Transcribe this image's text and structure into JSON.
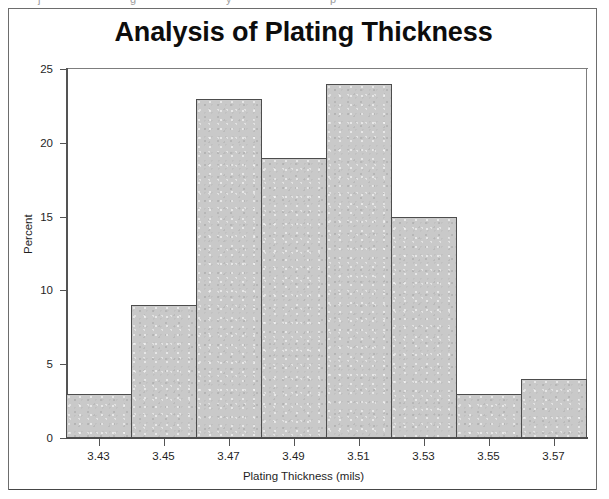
{
  "artifacts": {
    "top_strip_fragments": [
      "j",
      "g",
      "y",
      "p"
    ]
  },
  "chart_data": {
    "type": "bar",
    "title": "Analysis of Plating Thickness",
    "xlabel": "Plating Thickness (mils)",
    "ylabel": "Percent",
    "categories": [
      "3.43",
      "3.45",
      "3.47",
      "3.49",
      "3.51",
      "3.53",
      "3.55",
      "3.57"
    ],
    "values": [
      3,
      9,
      23,
      19,
      24,
      15,
      3,
      4
    ],
    "ylim": [
      0,
      25
    ],
    "yticks": [
      "0",
      "5",
      "10",
      "15",
      "20",
      "25"
    ],
    "ytick_values": [
      0,
      5,
      10,
      15,
      20,
      25
    ],
    "grid": false,
    "legend": false,
    "bar_fill_color": "#c9c9c9",
    "bar_edge_color": "#4d4d4d",
    "axis_color": "#545454",
    "text_color": "#1f1f1f",
    "background_color": "#ffffff"
  }
}
